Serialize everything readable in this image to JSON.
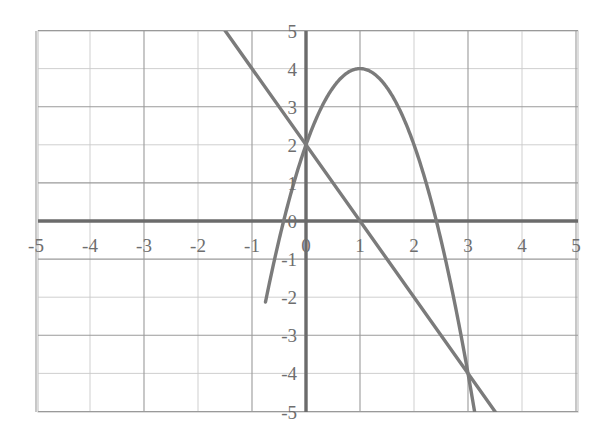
{
  "chart_data": {
    "type": "line",
    "title": "",
    "subtitle": "",
    "xlabel": "",
    "ylabel": "",
    "xlim": [
      -5,
      5
    ],
    "ylim": [
      -5,
      5
    ],
    "grid": true,
    "legend": null,
    "x_ticks": [
      "-5",
      "-4",
      "-3",
      "-2",
      "-1",
      "0",
      "1",
      "2",
      "3",
      "4",
      "5"
    ],
    "x_tick_values": [
      -5,
      -4,
      -3,
      -2,
      -1,
      0,
      1,
      2,
      3,
      4,
      5
    ],
    "y_ticks": [
      "5",
      "4",
      "3",
      "2",
      "1",
      "0",
      "-1",
      "-2",
      "-3",
      "-4",
      "-5"
    ],
    "y_tick_values": [
      5,
      4,
      3,
      2,
      1,
      0,
      -1,
      -2,
      -3,
      -4,
      -5
    ],
    "x_major_step": 1,
    "y_major_step": 1,
    "axis_color": "#6b6b6b",
    "grid_color_minor": "#c9c9c9",
    "grid_color_major": "#9a9a9a",
    "curve_color": "#7b7b7b",
    "background_color": "#ffffff",
    "series": [
      {
        "name": "parabola",
        "kind": "quadratic",
        "equation": "y = -2x^2 + 4x + 2",
        "a": -2,
        "b": 4,
        "c": 2,
        "vertex": [
          1,
          4
        ],
        "y_intercept": 2,
        "x_domain": [
          -0.75,
          3.15
        ],
        "x": [
          -0.75,
          -0.5,
          -0.25,
          0,
          0.25,
          0.5,
          0.75,
          1,
          1.25,
          1.5,
          1.75,
          2,
          2.25,
          2.5,
          2.75,
          3,
          3.15
        ],
        "y": [
          -2.125,
          -0.5,
          0.875,
          2,
          2.875,
          3.5,
          3.875,
          4,
          3.875,
          3.5,
          2.875,
          2,
          0.875,
          -0.5,
          -2.125,
          -4,
          -5.245
        ]
      },
      {
        "name": "line",
        "kind": "linear",
        "equation": "y = -2x + 2",
        "slope": -2,
        "y_intercept": 2,
        "x_domain": [
          -1.55,
          3.6
        ],
        "x": [
          -1.55,
          0,
          1,
          2,
          3,
          3.6
        ],
        "y": [
          5.1,
          2,
          0,
          -2,
          -4,
          -5.2
        ]
      }
    ],
    "intersections": [
      {
        "point": [
          0,
          2
        ],
        "label": "(0, 2)"
      },
      {
        "point": [
          3,
          -4
        ],
        "label": "(3, -4)"
      }
    ]
  },
  "plot_geometry": {
    "left_px": 38,
    "right_px": 578,
    "top_px": 31,
    "bottom_px": 412,
    "origin_x_px": 306,
    "origin_y_px": 221,
    "unit_x_px": 54,
    "unit_y_px": 38.1
  }
}
